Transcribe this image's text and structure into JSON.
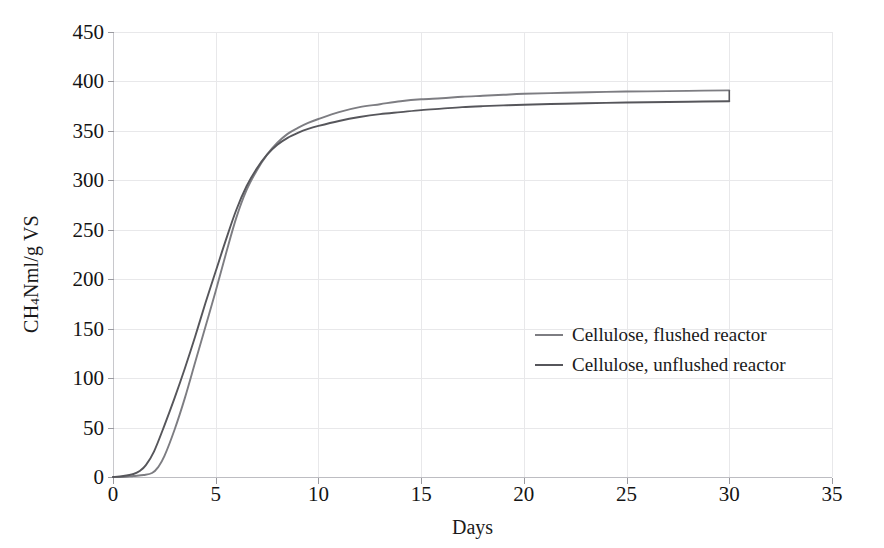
{
  "chart_data": {
    "type": "line",
    "title": "",
    "xlabel": "Days",
    "ylabel": "CH4 Nml/g VS",
    "ylabel_parts": {
      "prefix": "CH",
      "sub": "4",
      "suffix": " Nml/g VS"
    },
    "xlim": [
      0,
      35
    ],
    "ylim": [
      0,
      450
    ],
    "xticks": [
      0,
      5,
      10,
      15,
      20,
      25,
      30,
      35
    ],
    "yticks": [
      0,
      50,
      100,
      150,
      200,
      250,
      300,
      350,
      400,
      450
    ],
    "grid": true,
    "grid_axis": "both",
    "legend_position": "center-right",
    "series": [
      {
        "name": "Cellulose, flushed reactor",
        "color": "#7d7d82",
        "x": [
          0,
          0.5,
          1.0,
          1.5,
          1.9,
          2.2,
          2.5,
          3.0,
          3.5,
          4.0,
          4.5,
          5.0,
          5.5,
          6.0,
          6.5,
          7.0,
          7.5,
          8.0,
          8.5,
          9.0,
          9.5,
          10.0,
          11.0,
          12.0,
          13.0,
          14.0,
          15.0,
          16.0,
          17.0,
          18.0,
          19.0,
          20.0,
          22.0,
          24.0,
          26.0,
          28.0,
          30.0
        ],
        "y": [
          0,
          0,
          1,
          2,
          4,
          10,
          21,
          48,
          80,
          116,
          152,
          188,
          226,
          262,
          290,
          310,
          326,
          338,
          347,
          353,
          358,
          362,
          369,
          374,
          377,
          380,
          382,
          383,
          384.5,
          385.5,
          386.5,
          387.5,
          388.5,
          389.5,
          390,
          390.5,
          391
        ]
      },
      {
        "name": "Cellulose, unflushed reactor",
        "color": "#56565b",
        "x": [
          0,
          0.5,
          1.0,
          1.3,
          1.6,
          2.0,
          2.5,
          3.0,
          3.5,
          4.0,
          4.5,
          5.0,
          5.5,
          6.0,
          6.5,
          7.0,
          7.5,
          8.0,
          8.5,
          9.0,
          9.5,
          10.0,
          11.0,
          12.0,
          13.0,
          14.0,
          15.0,
          16.0,
          17.0,
          18.0,
          19.0,
          20.0,
          22.0,
          24.0,
          26.0,
          28.0,
          30.0
        ],
        "y": [
          0,
          1,
          3,
          6,
          12,
          26,
          52,
          80,
          110,
          142,
          176,
          208,
          240,
          270,
          294,
          312,
          326,
          336,
          343,
          348,
          352,
          355,
          360,
          364,
          367,
          369,
          371,
          372.5,
          374,
          375,
          375.8,
          376.5,
          377.5,
          378.3,
          379,
          379.5,
          380
        ]
      }
    ]
  },
  "legend": {
    "items": [
      {
        "label": "Cellulose, flushed reactor",
        "color": "#7d7d82"
      },
      {
        "label": "Cellulose, unflushed reactor",
        "color": "#56565b"
      }
    ]
  },
  "axes": {
    "x_title": "Days",
    "y_title_prefix": "CH",
    "y_title_sub": "4",
    "y_title_suffix": " Nml/g VS",
    "x_tick_labels": [
      "0",
      "5",
      "10",
      "15",
      "20",
      "25",
      "30",
      "35"
    ],
    "y_tick_labels": [
      "0",
      "50",
      "100",
      "150",
      "200",
      "250",
      "300",
      "350",
      "400",
      "450"
    ]
  },
  "colors": {
    "grid": "#e8e8ea",
    "spine": "#c8c8cc",
    "text": "#1a1a1a",
    "series_flushed": "#7d7d82",
    "series_unflushed": "#56565b"
  }
}
